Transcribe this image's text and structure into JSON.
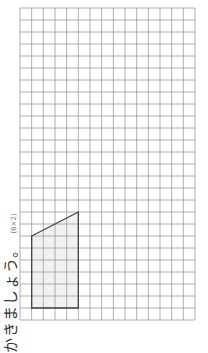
{
  "caption": {
    "instruction": "かきましょう。",
    "score": "(8×2)"
  },
  "grid": {
    "left": 20,
    "top": 8,
    "columns": 15,
    "rows": 26,
    "cell_width": 11.667,
    "cell_height": 12,
    "line_color": "#9a9a9a"
  },
  "shape": {
    "type": "trapezoid",
    "vertices_grid": [
      [
        1,
        19
      ],
      [
        5,
        17
      ],
      [
        5,
        25
      ],
      [
        1,
        25
      ]
    ],
    "stroke": "#444444",
    "fill": "#f1f1f1"
  }
}
